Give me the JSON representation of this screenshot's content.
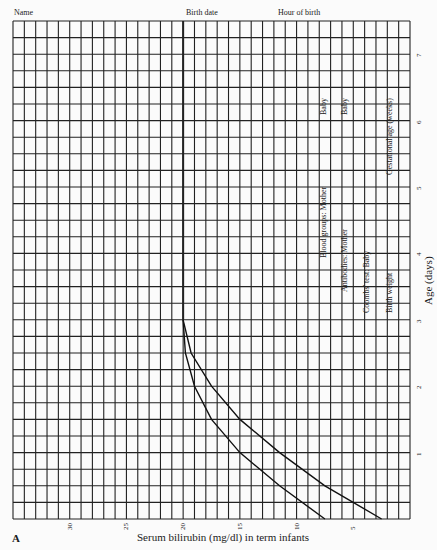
{
  "header": {
    "name_label": "Name",
    "birth_date_label": "Birth date",
    "hour_of_birth_label": "Hour of birth"
  },
  "side_fields": {
    "blood_groups_mother": "Blood groups: Mother",
    "blood_groups_baby": "Baby",
    "antibodies_mother": "Antibodies: Mother",
    "antibodies_baby": "Baby",
    "coombs_test_baby": "Coombs' test: Baby",
    "birth_weight": "Birth weight",
    "gestational_age": "Gestational age (weeks)"
  },
  "panel_label": "A",
  "chart_data": {
    "type": "line",
    "title": "",
    "xlabel": "Serum bilirubin (mg/dl) in term infants",
    "ylabel": "Age (days)",
    "x_ticks": [
      "30",
      "25",
      "20",
      "15",
      "10",
      "5"
    ],
    "y_ticks": [
      "1",
      "2",
      "3",
      "4",
      "5",
      "6",
      "7"
    ],
    "xlim": [
      35,
      0
    ],
    "ylim": [
      0,
      7.5
    ],
    "grid": true,
    "orientation": "rotated 90 degrees (age on vertical right axis, bilirubin decreasing left-to-right)",
    "series": [
      {
        "name": "lower threshold curve",
        "points": [
          {
            "age_days": 0.0,
            "bilirubin": 7.5
          },
          {
            "age_days": 0.5,
            "bilirubin": 11.5
          },
          {
            "age_days": 1.0,
            "bilirubin": 15.0
          },
          {
            "age_days": 1.5,
            "bilirubin": 17.5
          },
          {
            "age_days": 2.0,
            "bilirubin": 19.0
          },
          {
            "age_days": 2.5,
            "bilirubin": 19.8
          },
          {
            "age_days": 3.0,
            "bilirubin": 20.0
          },
          {
            "age_days": 7.5,
            "bilirubin": 20.0
          }
        ]
      },
      {
        "name": "upper threshold curve",
        "points": [
          {
            "age_days": 0.0,
            "bilirubin": 2.5
          },
          {
            "age_days": 0.5,
            "bilirubin": 7.5
          },
          {
            "age_days": 1.0,
            "bilirubin": 11.5
          },
          {
            "age_days": 1.5,
            "bilirubin": 15.0
          },
          {
            "age_days": 2.0,
            "bilirubin": 17.5
          },
          {
            "age_days": 2.5,
            "bilirubin": 19.3
          },
          {
            "age_days": 3.0,
            "bilirubin": 20.0
          },
          {
            "age_days": 7.5,
            "bilirubin": 20.0
          }
        ]
      }
    ]
  }
}
